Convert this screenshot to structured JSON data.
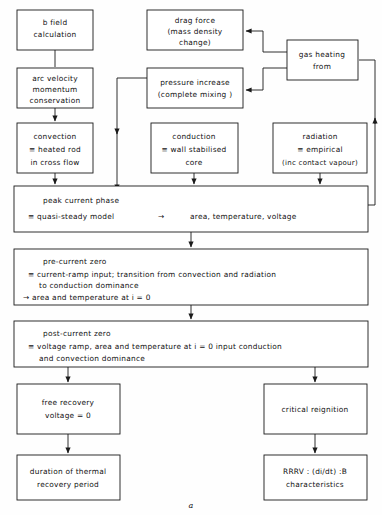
{
  "figure": {
    "caption": "a",
    "colors": {
      "line": "#1a1a1a",
      "box_fill": "#ffffff",
      "background": "#fefefe",
      "text": "#111111"
    }
  },
  "nodes": {
    "b_field": {
      "lines": [
        "b field",
        "calculation"
      ],
      "x": 17,
      "y": 10,
      "w": 76,
      "h": 40
    },
    "arc_velocity": {
      "lines": [
        "arc velocity",
        "momentum",
        "conservation"
      ],
      "x": 17,
      "y": 68,
      "w": 76,
      "h": 40
    },
    "convection": {
      "lines": [
        "convection",
        "≡ heated rod",
        "in cross flow"
      ],
      "x": 17,
      "y": 123,
      "w": 76,
      "h": 50
    },
    "drag_force": {
      "lines": [
        "drag force",
        "(mass density",
        "change)"
      ],
      "x": 147,
      "y": 10,
      "w": 96,
      "h": 40
    },
    "pressure_increase": {
      "lines": [
        "pressure increase",
        "(complete mixing )"
      ],
      "x": 147,
      "y": 68,
      "w": 96,
      "h": 40
    },
    "gas_heating": {
      "lines": [
        "gas heating",
        "from"
      ],
      "x": 287,
      "y": 40,
      "w": 71,
      "h": 40
    },
    "conduction": {
      "lines": [
        "conduction",
        "≡ wall stabilised",
        "core"
      ],
      "x": 151,
      "y": 123,
      "w": 87,
      "h": 50
    },
    "radiation": {
      "lines": [
        "radiation",
        "≡ empirical",
        "(inc contact vapour)"
      ],
      "x": 273,
      "y": 123,
      "w": 94,
      "h": 50
    },
    "peak_current_phase": {
      "lines": [
        "peak current phase",
        "≡ quasi-steady model        →         area, temperature, voltage"
      ],
      "title": "peak current phase",
      "detail_equiv": "≡ quasi-steady model",
      "detail_arrow": "→",
      "detail_result": "area, temperature, voltage",
      "x": 14,
      "y": 186,
      "w": 354,
      "h": 46
    },
    "pre_current_zero": {
      "title": "pre-current zero",
      "lines": [
        "≡ current-ramp input;  transition from convection and radiation",
        "to conduction dominance",
        "→ area and temperature at i = 0"
      ],
      "x": 14,
      "y": 249,
      "w": 354,
      "h": 56
    },
    "post_current_zero": {
      "title": "post-current zero",
      "lines": [
        "≡ voltage ramp, area and temperature at i = 0  input conduction",
        "and convection dominance"
      ],
      "x": 14,
      "y": 321,
      "w": 354,
      "h": 46
    },
    "free_recovery": {
      "lines": [
        "free recovery",
        "voltage = 0"
      ],
      "x": 17,
      "y": 384,
      "w": 103,
      "h": 50
    },
    "duration_thermal": {
      "lines": [
        "duration of thermal",
        "recovery period"
      ],
      "x": 17,
      "y": 455,
      "w": 103,
      "h": 45
    },
    "critical_reignition": {
      "lines": [
        "critical reignition"
      ],
      "x": 264,
      "y": 384,
      "w": 103,
      "h": 50
    },
    "rrrv": {
      "lines": [
        "RRRV :  (di/dt)  :B",
        "characteristics"
      ],
      "x": 264,
      "y": 455,
      "w": 103,
      "h": 45
    }
  },
  "connections": [
    {
      "name": "b-field-to-arc-velocity",
      "from": "b_field",
      "to": "arc_velocity"
    },
    {
      "name": "arc-velocity-to-convection",
      "from": "arc_velocity",
      "to": "convection"
    },
    {
      "name": "convection-to-peak-current",
      "from": "convection",
      "to": "peak_current_phase"
    },
    {
      "name": "conduction-to-peak-current",
      "from": "conduction",
      "to": "peak_current_phase"
    },
    {
      "name": "radiation-to-peak-current",
      "from": "radiation",
      "to": "peak_current_phase"
    },
    {
      "name": "gas-heating-to-drag-force",
      "from": "gas_heating",
      "to": "drag_force"
    },
    {
      "name": "gas-heating-to-pressure-increase",
      "from": "gas_heating",
      "to": "pressure_increase"
    },
    {
      "name": "pressure-increase-to-peak-current",
      "from": "pressure_increase",
      "to": "peak_current_phase"
    },
    {
      "name": "peak-current-to-gas-heating-feedback",
      "from": "peak_current_phase",
      "to": "gas_heating"
    },
    {
      "name": "peak-current-to-pre-current-zero",
      "from": "peak_current_phase",
      "to": "pre_current_zero"
    },
    {
      "name": "pre-current-zero-to-post-current-zero",
      "from": "pre_current_zero",
      "to": "post_current_zero"
    },
    {
      "name": "post-current-zero-to-free-recovery",
      "from": "post_current_zero",
      "to": "free_recovery"
    },
    {
      "name": "post-current-zero-to-critical-reignition",
      "from": "post_current_zero",
      "to": "critical_reignition"
    },
    {
      "name": "free-recovery-to-duration-thermal",
      "from": "free_recovery",
      "to": "duration_thermal"
    },
    {
      "name": "critical-reignition-to-rrrv",
      "from": "critical_reignition",
      "to": "rrrv"
    }
  ]
}
